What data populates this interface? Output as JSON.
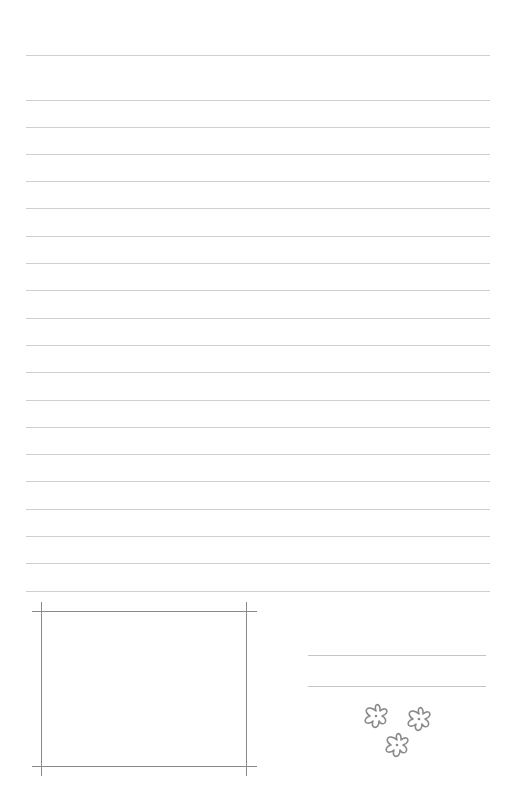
{
  "document": {
    "type": "lined-letter-paper",
    "line_color": "#cfcfcf",
    "frame_color": "#8a8a8a",
    "ruled_lines_y": [
      55,
      100,
      127,
      154,
      181,
      208,
      236,
      263,
      290,
      318,
      345,
      372,
      400,
      427,
      454,
      481,
      509,
      536,
      563,
      591
    ],
    "photo_frame": {
      "top": 611,
      "bottom": 766,
      "left": 41,
      "right": 246
    },
    "signature_lines_y": [
      655,
      686
    ],
    "decoration": {
      "name": "three-flowers",
      "count": 3
    }
  }
}
